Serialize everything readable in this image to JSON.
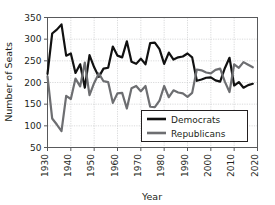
{
  "chart_data": {
    "type": "line",
    "title": "",
    "xlabel": "Year",
    "ylabel": "Number of Seats",
    "xlim": [
      1930,
      2020
    ],
    "ylim": [
      50,
      350
    ],
    "xticks": [
      1930,
      1940,
      1950,
      1960,
      1970,
      1980,
      1990,
      2000,
      2010,
      2020
    ],
    "yticks": [
      50,
      100,
      150,
      200,
      250,
      300,
      350
    ],
    "xtick_labels": [
      "1930",
      "1940",
      "1950",
      "1960",
      "1970",
      "1980",
      "1990",
      "2000",
      "2010",
      "2020"
    ],
    "ytick_labels": [
      "50",
      "100",
      "150",
      "200",
      "250",
      "300",
      "350"
    ],
    "grid": true,
    "legend_position": "lower right",
    "x": [
      1930,
      1932,
      1934,
      1936,
      1938,
      1940,
      1942,
      1944,
      1946,
      1948,
      1950,
      1952,
      1954,
      1956,
      1958,
      1960,
      1962,
      1964,
      1966,
      1968,
      1970,
      1972,
      1974,
      1976,
      1978,
      1980,
      1982,
      1984,
      1986,
      1988,
      1990,
      1992,
      1994,
      1996,
      1998,
      2000,
      2002,
      2004,
      2006,
      2008,
      2010,
      2012,
      2014,
      2016,
      2018
    ],
    "series": [
      {
        "name": "Democrats",
        "color": "#111111",
        "values": [
          220,
          313,
          322,
          334,
          262,
          267,
          222,
          242,
          188,
          263,
          235,
          213,
          232,
          234,
          283,
          262,
          258,
          295,
          248,
          243,
          255,
          242,
          291,
          292,
          277,
          243,
          269,
          253,
          258,
          260,
          267,
          258,
          204,
          207,
          211,
          212,
          205,
          202,
          233,
          257,
          193,
          201,
          188,
          194,
          197
        ]
      },
      {
        "name": "Republicans",
        "color": "#6d6e71",
        "values": [
          214,
          117,
          103,
          88,
          169,
          162,
          209,
          191,
          246,
          171,
          199,
          221,
          203,
          201,
          153,
          175,
          176,
          140,
          187,
          192,
          180,
          192,
          144,
          143,
          158,
          192,
          166,
          182,
          177,
          175,
          167,
          176,
          230,
          228,
          223,
          221,
          229,
          232,
          202,
          178,
          242,
          234,
          247,
          241,
          235
        ]
      }
    ]
  },
  "legend": {
    "entries": [
      {
        "label": "Democrats",
        "color": "#111111"
      },
      {
        "label": "Republicans",
        "color": "#6d6e71"
      }
    ]
  },
  "axes": {
    "x_title": "Year",
    "y_title": "Number of Seats"
  }
}
